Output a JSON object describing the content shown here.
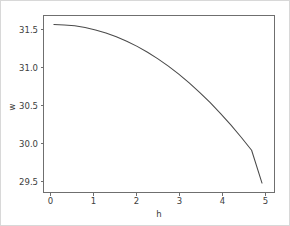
{
  "chart_data": {
    "type": "line",
    "title": "",
    "xlabel": "h",
    "ylabel": "w",
    "xlim": [
      -0.25,
      5.3
    ],
    "ylim": [
      29.28,
      31.72
    ],
    "xticks": [
      "0",
      "1",
      "2",
      "3",
      "4",
      "5"
    ],
    "xtick_values": [
      0,
      1,
      2,
      3,
      4,
      5
    ],
    "yticks": [
      "29.5",
      "30.0",
      "30.5",
      "31.0",
      "31.5"
    ],
    "ytick_values": [
      29.5,
      30.0,
      30.5,
      31.0,
      31.5
    ],
    "grid": false,
    "legend": null,
    "series": [
      {
        "name": "w(h)",
        "color": "#4a4a4a",
        "x": [
          0.0,
          0.25,
          0.5,
          0.75,
          1.0,
          1.25,
          1.5,
          1.75,
          2.0,
          2.25,
          2.5,
          2.75,
          3.0,
          3.25,
          3.5,
          3.75,
          4.0,
          4.25,
          4.5,
          4.75,
          5.0
        ],
        "y": [
          31.595,
          31.59,
          31.578,
          31.554,
          31.521,
          31.479,
          31.427,
          31.365,
          31.294,
          31.213,
          31.122,
          31.022,
          30.911,
          30.791,
          30.661,
          30.521,
          30.371,
          30.211,
          30.042,
          29.862,
          29.41
        ]
      }
    ]
  },
  "figure": {
    "background": "#ffffff",
    "border_color": "#d8d8d8",
    "axes_color": "#6f6f6f",
    "text_color": "#3d3d3d"
  }
}
